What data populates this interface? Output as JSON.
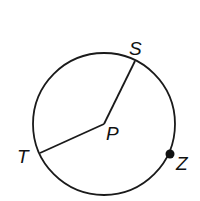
{
  "diagram": {
    "type": "circle-geometry",
    "circle": {
      "cx": 104,
      "cy": 124,
      "r": 72,
      "stroke": "#1a1a1a"
    },
    "center": {
      "label": "P",
      "x": 104,
      "y": 124
    },
    "points": [
      {
        "label": "S",
        "x": 135,
        "y": 59,
        "on": "circle"
      },
      {
        "label": "T",
        "x": 40,
        "y": 153,
        "on": "circle"
      },
      {
        "label": "Z",
        "x": 170,
        "y": 154,
        "on": "circle",
        "marked": true
      }
    ],
    "segments": [
      {
        "from": "P",
        "to": "S"
      },
      {
        "from": "P",
        "to": "T"
      }
    ],
    "labels": {
      "S": "S",
      "P": "P",
      "T": "T",
      "Z": "Z"
    }
  }
}
